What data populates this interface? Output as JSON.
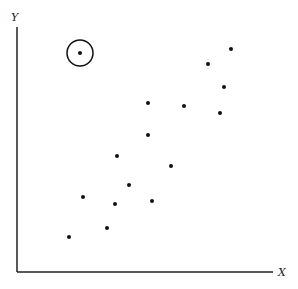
{
  "chart_data": {
    "type": "scatter",
    "title": "",
    "xlabel": "X",
    "ylabel": "Y",
    "grid": false,
    "legend": null,
    "ticks": false,
    "annotation": "Circled outlier point in upper-left",
    "points": [
      {
        "x": 80,
        "y": 53,
        "outlier": true
      },
      {
        "x": 231,
        "y": 49
      },
      {
        "x": 208,
        "y": 64
      },
      {
        "x": 224,
        "y": 87
      },
      {
        "x": 220,
        "y": 113
      },
      {
        "x": 148,
        "y": 103
      },
      {
        "x": 184,
        "y": 106
      },
      {
        "x": 148,
        "y": 135
      },
      {
        "x": 171,
        "y": 166
      },
      {
        "x": 117,
        "y": 156
      },
      {
        "x": 129,
        "y": 185
      },
      {
        "x": 83,
        "y": 197
      },
      {
        "x": 115,
        "y": 204
      },
      {
        "x": 152,
        "y": 201
      },
      {
        "x": 107,
        "y": 228
      },
      {
        "x": 69,
        "y": 237
      }
    ],
    "coordinate_note": "points given in pixel coordinates of the 298x289 figure (y downward)"
  },
  "layout": {
    "origin": {
      "x": 17,
      "y": 272
    },
    "y_axis_top": 27,
    "x_axis_right": 273,
    "outlier_ring_radius": 13,
    "point_radius": 2
  },
  "labels": {
    "x_axis": "X",
    "y_axis": "Y"
  }
}
